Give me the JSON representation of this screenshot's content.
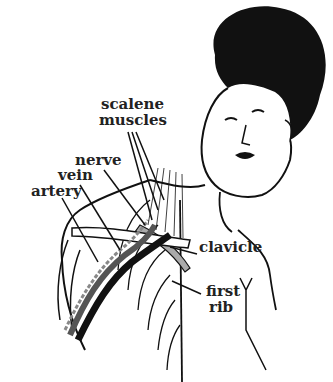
{
  "diagram": {
    "labels": {
      "scalene_line1": "scalene",
      "scalene_line2": "muscles",
      "nerve": "nerve",
      "vein": "vein",
      "artery": "artery",
      "clavicle": "clavicle",
      "first_rib_line1": "first",
      "first_rib_line2": "rib"
    },
    "colors": {
      "ink": "#111111",
      "background": "#ffffff"
    }
  }
}
